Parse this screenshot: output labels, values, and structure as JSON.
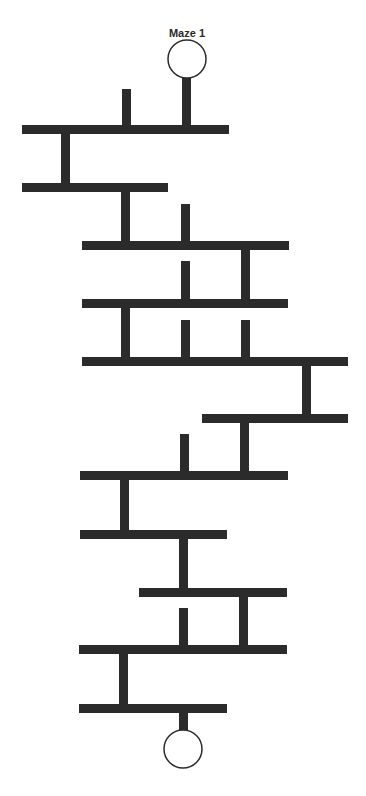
{
  "title": "Maze 1",
  "colors": {
    "path": "#2b2b2b",
    "background": "#ffffff"
  },
  "start": {
    "label": "start-circle",
    "cx": 187,
    "cy": 59,
    "r": 19
  },
  "end": {
    "label": "end-circle",
    "cx": 183,
    "cy": 749,
    "r": 19
  },
  "bars": [
    {
      "x1": 22,
      "x2": 229,
      "y": 125
    },
    {
      "x1": 22,
      "x2": 168,
      "y": 183
    },
    {
      "x1": 82,
      "x2": 289,
      "y": 241
    },
    {
      "x1": 82,
      "x2": 288,
      "y": 299
    },
    {
      "x1": 82,
      "x2": 348,
      "y": 357
    },
    {
      "x1": 202,
      "x2": 348,
      "y": 414
    },
    {
      "x1": 80,
      "x2": 288,
      "y": 471
    },
    {
      "x1": 80,
      "x2": 227,
      "y": 530
    },
    {
      "x1": 139,
      "x2": 287,
      "y": 588
    },
    {
      "x1": 79,
      "x2": 287,
      "y": 645
    },
    {
      "x1": 79,
      "x2": 227,
      "y": 704
    }
  ],
  "verticals": [
    {
      "x": 182,
      "y1": 78,
      "y2": 125,
      "kind": "entry"
    },
    {
      "x": 122,
      "y1": 89,
      "y2": 125,
      "kind": "dead-end"
    },
    {
      "x": 61,
      "y1": 125,
      "y2": 183,
      "kind": "connector"
    },
    {
      "x": 121,
      "y1": 183,
      "y2": 241,
      "kind": "connector"
    },
    {
      "x": 181,
      "y1": 204,
      "y2": 241,
      "kind": "dead-end"
    },
    {
      "x": 241,
      "y1": 241,
      "y2": 299,
      "kind": "connector"
    },
    {
      "x": 181,
      "y1": 261,
      "y2": 299,
      "kind": "dead-end"
    },
    {
      "x": 121,
      "y1": 299,
      "y2": 357,
      "kind": "connector"
    },
    {
      "x": 181,
      "y1": 320,
      "y2": 357,
      "kind": "dead-end"
    },
    {
      "x": 241,
      "y1": 320,
      "y2": 357,
      "kind": "dead-end"
    },
    {
      "x": 302,
      "y1": 357,
      "y2": 414,
      "kind": "connector"
    },
    {
      "x": 240,
      "y1": 414,
      "y2": 471,
      "kind": "connector"
    },
    {
      "x": 180,
      "y1": 434,
      "y2": 471,
      "kind": "dead-end"
    },
    {
      "x": 120,
      "y1": 471,
      "y2": 530,
      "kind": "connector"
    },
    {
      "x": 179,
      "y1": 530,
      "y2": 588,
      "kind": "connector"
    },
    {
      "x": 239,
      "y1": 588,
      "y2": 645,
      "kind": "connector"
    },
    {
      "x": 179,
      "y1": 608,
      "y2": 645,
      "kind": "dead-end"
    },
    {
      "x": 119,
      "y1": 645,
      "y2": 704,
      "kind": "connector"
    },
    {
      "x": 179,
      "y1": 704,
      "y2": 731,
      "kind": "exit"
    }
  ]
}
